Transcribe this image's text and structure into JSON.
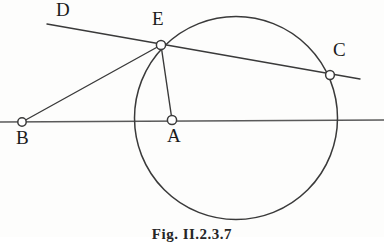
{
  "figure": {
    "caption": "Fig. II.2.3.7",
    "caption_position": {
      "x": 0,
      "y": 226
    },
    "canvas": {
      "width": 384,
      "height": 237
    },
    "background_color": "#fdfdfc",
    "stroke_color": "#3a3a3a",
    "marker_fill": "#ffffff",
    "label_color": "#1b1b1b"
  },
  "points": [
    {
      "id": "B",
      "label": "B",
      "marker": {
        "x": 22,
        "y": 122,
        "r": 4.2
      },
      "label_pos": {
        "x": 16,
        "y": 128
      },
      "role": "external-point"
    },
    {
      "id": "A",
      "label": "A",
      "marker": {
        "x": 172,
        "y": 120,
        "r": 4.6
      },
      "label_pos": {
        "x": 167,
        "y": 126
      },
      "role": "circle-center"
    },
    {
      "id": "E",
      "label": "E",
      "marker": {
        "x": 161,
        "y": 45,
        "r": 4.6
      },
      "label_pos": {
        "x": 152,
        "y": 9
      },
      "role": "tangency-point"
    },
    {
      "id": "C",
      "label": "C",
      "marker": {
        "x": 330,
        "y": 75,
        "r": 4.4
      },
      "label_pos": {
        "x": 333,
        "y": 40
      },
      "role": "circle-intersection"
    },
    {
      "id": "D",
      "label": "D",
      "marker": null,
      "label_pos": {
        "x": 56,
        "y": 0
      },
      "role": "ray-endpoint-label"
    }
  ],
  "circle": {
    "id": "circle-A",
    "center": {
      "x": 236,
      "y": 118
    },
    "radius": 101.5
  },
  "segments": [
    {
      "id": "line-BC-horizontal",
      "name": "horizontal-base-line",
      "from": {
        "x": 0,
        "y": 122
      },
      "to": {
        "x": 384,
        "y": 120
      },
      "width": 1.5,
      "color": "#5a5a5a"
    },
    {
      "id": "line-DEC",
      "name": "secant-line-D-E-C",
      "from": {
        "x": 47,
        "y": 24
      },
      "to": {
        "x": 360,
        "y": 79
      },
      "width": 1.4,
      "color": "#3a3a3a"
    },
    {
      "id": "segment-BE",
      "name": "segment-B-to-E",
      "from": {
        "x": 22,
        "y": 122
      },
      "to": {
        "x": 161,
        "y": 45
      },
      "width": 1.4,
      "color": "#3a3a3a"
    },
    {
      "id": "segment-EA",
      "name": "radius-E-to-A",
      "from": {
        "x": 161,
        "y": 45
      },
      "to": {
        "x": 172,
        "y": 120
      },
      "width": 1.4,
      "color": "#3a3a3a"
    }
  ]
}
